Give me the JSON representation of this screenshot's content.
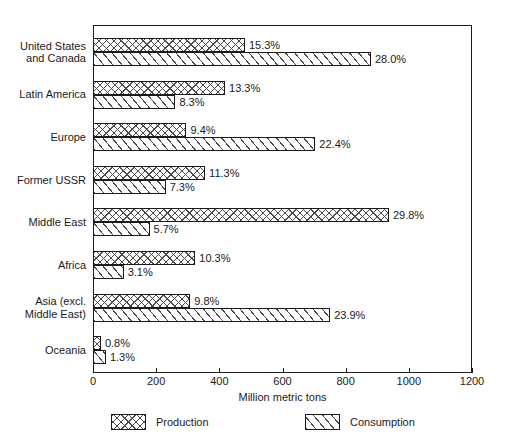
{
  "chart_data": {
    "type": "bar",
    "orientation": "horizontal",
    "title": "",
    "xlabel": "Million metric tons",
    "ylabel": "",
    "xlim": [
      0,
      1200
    ],
    "xticks": [
      0,
      200,
      400,
      600,
      800,
      1000,
      1200
    ],
    "xtick_labels": [
      "0",
      "200",
      "400",
      "600",
      "800",
      "1000",
      "1200"
    ],
    "grid": false,
    "legend_position": "bottom",
    "categories": [
      "United States\nand Canada",
      "Latin America",
      "Europe",
      "Former USSR",
      "Middle East",
      "Africa",
      "Asia (excl.\nMiddle East)",
      "Oceania"
    ],
    "series": [
      {
        "name": "Production",
        "pattern": "cross-hatch",
        "values": [
          481,
          418,
          296,
          355,
          937,
          324,
          308,
          25
        ],
        "data_labels": [
          "15.3%",
          "13.3%",
          "9.4%",
          "11.3%",
          "29.8%",
          "10.3%",
          "9.8%",
          "0.8%"
        ]
      },
      {
        "name": "Consumption",
        "pattern": "diagonal-hatch",
        "values": [
          880,
          261,
          704,
          230,
          179,
          97,
          751,
          41
        ],
        "data_labels": [
          "28.0%",
          "8.3%",
          "22.4%",
          "7.3%",
          "5.7%",
          "3.1%",
          "23.9%",
          "1.3%"
        ]
      }
    ]
  },
  "colors": {
    "ink": "#1a1a1a",
    "hatch": "#4a4a4a",
    "background": "#ffffff"
  }
}
